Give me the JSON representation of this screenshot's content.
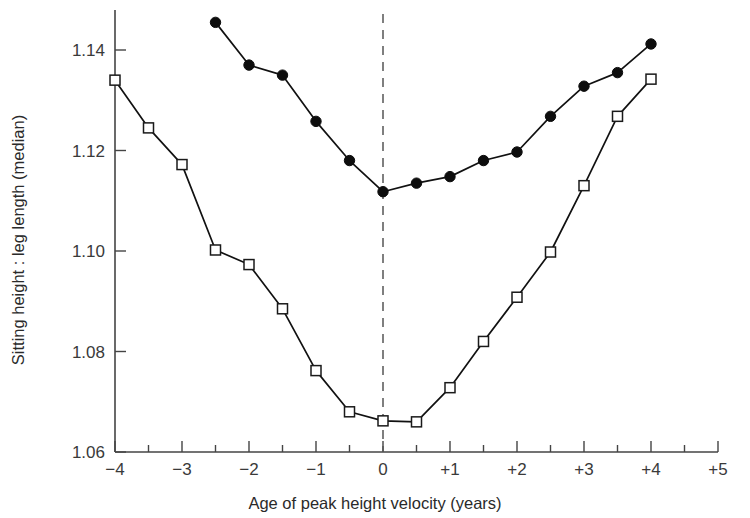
{
  "chart_data": {
    "type": "line",
    "title": "",
    "subtitle": "",
    "xlabel": "Age of peak height velocity (years)",
    "ylabel": "Sitting height : leg length (median)",
    "xlim": [
      -4,
      5
    ],
    "ylim": [
      1.06,
      1.148
    ],
    "grid": false,
    "legend": "none",
    "x_major_ticks": [
      -4,
      -3,
      -2,
      -1,
      0,
      1,
      2,
      3,
      4,
      5
    ],
    "x_tick_labels": [
      "−4",
      "−3",
      "−2",
      "−1",
      "0",
      "+1",
      "+2",
      "+3",
      "+4",
      "+5"
    ],
    "x_minor_tick_step": 0.5,
    "y_major_ticks": [
      1.06,
      1.08,
      1.1,
      1.12,
      1.14
    ],
    "y_tick_labels": [
      "1.06",
      "1.08",
      "1.10",
      "1.12",
      "1.14"
    ],
    "annotations": [
      {
        "name": "peak-height-velocity-reference",
        "type": "vertical-dashed-line",
        "x": 0
      }
    ],
    "series": [
      {
        "name": "filled-circle-series",
        "marker": "filled-circle",
        "points": [
          {
            "x": -2.5,
            "y": 1.1455
          },
          {
            "x": -2.0,
            "y": 1.137
          },
          {
            "x": -1.5,
            "y": 1.135
          },
          {
            "x": -1.0,
            "y": 1.1258
          },
          {
            "x": -0.5,
            "y": 1.118
          },
          {
            "x": 0.0,
            "y": 1.1118
          },
          {
            "x": 0.5,
            "y": 1.1135
          },
          {
            "x": 1.0,
            "y": 1.1148
          },
          {
            "x": 1.5,
            "y": 1.118
          },
          {
            "x": 2.0,
            "y": 1.1197
          },
          {
            "x": 2.5,
            "y": 1.1268
          },
          {
            "x": 3.0,
            "y": 1.1328
          },
          {
            "x": 3.5,
            "y": 1.1355
          },
          {
            "x": 4.0,
            "y": 1.1412
          }
        ]
      },
      {
        "name": "open-square-series",
        "marker": "open-square",
        "points": [
          {
            "x": -4.0,
            "y": 1.134
          },
          {
            "x": -3.5,
            "y": 1.1245
          },
          {
            "x": -3.0,
            "y": 1.1172
          },
          {
            "x": -2.5,
            "y": 1.1002
          },
          {
            "x": -2.0,
            "y": 1.0973
          },
          {
            "x": -1.5,
            "y": 1.0885
          },
          {
            "x": -1.0,
            "y": 1.0762
          },
          {
            "x": -0.5,
            "y": 1.068
          },
          {
            "x": 0.0,
            "y": 1.0662
          },
          {
            "x": 0.5,
            "y": 1.066
          },
          {
            "x": 1.0,
            "y": 1.0728
          },
          {
            "x": 1.5,
            "y": 1.082
          },
          {
            "x": 2.0,
            "y": 1.0908
          },
          {
            "x": 2.5,
            "y": 1.0998
          },
          {
            "x": 3.0,
            "y": 1.113
          },
          {
            "x": 3.5,
            "y": 1.1268
          },
          {
            "x": 4.0,
            "y": 1.1342
          }
        ]
      }
    ]
  }
}
